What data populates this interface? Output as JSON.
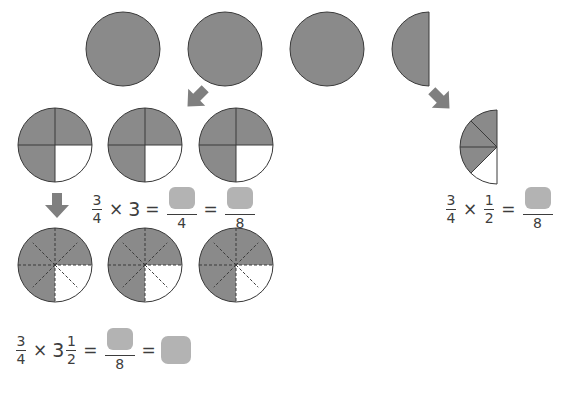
{
  "colors": {
    "shaded": "#8a8a8a",
    "outline": "#3a3a3a",
    "unshaded": "#ffffff",
    "arrow": "#7f7f7f",
    "answer_blank": "#b3b3b3",
    "text": "#3d3d3d"
  },
  "row_wholes": {
    "description": "Three whole circles and one half circle representing 3 1/2",
    "circles": [
      {
        "cx": 123,
        "cy": 49,
        "r": 37,
        "type": "whole",
        "shaded_fraction": "1"
      },
      {
        "cx": 225,
        "cy": 49,
        "r": 37,
        "type": "whole",
        "shaded_fraction": "1"
      },
      {
        "cx": 327,
        "cy": 49,
        "r": 37,
        "type": "whole",
        "shaded_fraction": "1"
      }
    ],
    "half": {
      "cx": 429,
      "cy": 49,
      "r": 37,
      "type": "left-half",
      "shaded_fraction": "1/2"
    }
  },
  "arrows": [
    {
      "name": "arrow-down-left",
      "direction": "down-left",
      "x": 183,
      "y": 85
    },
    {
      "name": "arrow-down-right",
      "direction": "down-right",
      "x": 428,
      "y": 87
    },
    {
      "name": "arrow-down",
      "direction": "down",
      "x": 44,
      "y": 193
    }
  ],
  "row_quarters": {
    "description": "Three circles divided into quarters, 3/4 shaded (bottom-right quarter white)",
    "circles": [
      {
        "cx": 55,
        "cy": 145,
        "r": 37,
        "parts": 4,
        "shaded": 3
      },
      {
        "cx": 145,
        "cy": 145,
        "r": 37,
        "parts": 4,
        "shaded": 3
      },
      {
        "cx": 236,
        "cy": 145,
        "r": 37,
        "parts": 4,
        "shaded": 3
      }
    ]
  },
  "row_eighths": {
    "description": "Three circles divided into eighths with dashed lines, 6/8 shaded",
    "circles": [
      {
        "cx": 55,
        "cy": 265,
        "r": 37,
        "parts": 8,
        "shaded": 6
      },
      {
        "cx": 145,
        "cy": 265,
        "r": 37,
        "parts": 8,
        "shaded": 6
      },
      {
        "cx": 236,
        "cy": 265,
        "r": 37,
        "parts": 8,
        "shaded": 6
      }
    ]
  },
  "half_split": {
    "description": "Half circle split into 4 parts (eighths), 3 shaded",
    "cx": 497,
    "cy": 147,
    "r": 37,
    "parts": 4,
    "shaded": 3
  },
  "equations": {
    "eq1": {
      "a_num": "3",
      "a_den": "4",
      "times": "×",
      "b_whole": "3",
      "equals1": "=",
      "c_den": "4",
      "equals2": "=",
      "d_den": "8"
    },
    "eq2": {
      "a_num": "3",
      "a_den": "4",
      "times": "×",
      "b_num": "1",
      "b_den": "2",
      "equals": "=",
      "c_den": "8"
    },
    "eq3": {
      "a_num": "3",
      "a_den": "4",
      "times": "×",
      "b_whole": "3",
      "b_num": "1",
      "b_den": "2",
      "equals1": "=",
      "c_den": "8",
      "equals2": "="
    }
  }
}
